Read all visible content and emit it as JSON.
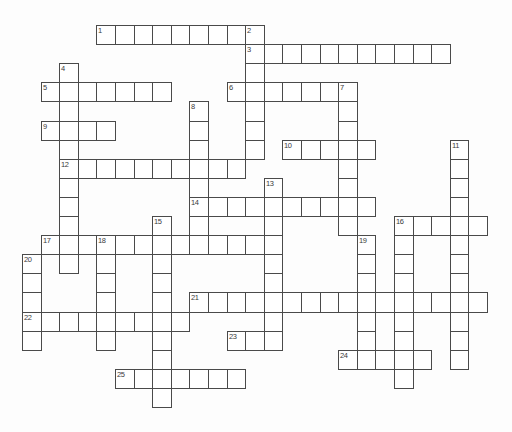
{
  "page": {
    "background_color": "#fdfdfd"
  },
  "grid": {
    "border_color": "#4a4a4a",
    "cell_fill_color": "#ffffff",
    "number_color": "#3a3a3a"
  },
  "puzzle": {
    "type": "crossword",
    "clue_numbers": [
      "1",
      "2",
      "3",
      "4",
      "5",
      "6",
      "7",
      "8",
      "9",
      "10",
      "11",
      "12",
      "13",
      "14",
      "15",
      "16",
      "17",
      "18",
      "19",
      "20",
      "21",
      "22",
      "23",
      "24",
      "25"
    ],
    "words": [
      {
        "num": "1",
        "dir": "across",
        "col": 4,
        "row": 0,
        "len": 9
      },
      {
        "num": "2",
        "dir": "down",
        "col": 12,
        "row": 0,
        "len": 7
      },
      {
        "num": "3",
        "dir": "across",
        "col": 12,
        "row": 1,
        "len": 11
      },
      {
        "num": "4",
        "dir": "down",
        "col": 2,
        "row": 2,
        "len": 11
      },
      {
        "num": "5",
        "dir": "across",
        "col": 1,
        "row": 3,
        "len": 7
      },
      {
        "num": "6",
        "dir": "across",
        "col": 11,
        "row": 3,
        "len": 7
      },
      {
        "num": "7",
        "dir": "down",
        "col": 17,
        "row": 3,
        "len": 8
      },
      {
        "num": "8",
        "dir": "down",
        "col": 9,
        "row": 4,
        "len": 8
      },
      {
        "num": "9",
        "dir": "across",
        "col": 1,
        "row": 5,
        "len": 4
      },
      {
        "num": "10",
        "dir": "across",
        "col": 14,
        "row": 6,
        "len": 5
      },
      {
        "num": "11",
        "dir": "down",
        "col": 23,
        "row": 6,
        "len": 12
      },
      {
        "num": "12",
        "dir": "across",
        "col": 2,
        "row": 7,
        "len": 10
      },
      {
        "num": "13",
        "dir": "down",
        "col": 13,
        "row": 8,
        "len": 9
      },
      {
        "num": "14",
        "dir": "across",
        "col": 9,
        "row": 9,
        "len": 10
      },
      {
        "num": "15",
        "dir": "down",
        "col": 7,
        "row": 10,
        "len": 10
      },
      {
        "num": "16",
        "dir": "across",
        "col": 20,
        "row": 10,
        "len": 5
      },
      {
        "num": "16",
        "dir": "down",
        "col": 20,
        "row": 10,
        "len": 9
      },
      {
        "num": "17",
        "dir": "across",
        "col": 1,
        "row": 11,
        "len": 12
      },
      {
        "num": "18",
        "dir": "down",
        "col": 4,
        "row": 11,
        "len": 6
      },
      {
        "num": "19",
        "dir": "down",
        "col": 18,
        "row": 11,
        "len": 7
      },
      {
        "num": "20",
        "dir": "down",
        "col": 0,
        "row": 12,
        "len": 5
      },
      {
        "num": "21",
        "dir": "across",
        "col": 9,
        "row": 14,
        "len": 16
      },
      {
        "num": "22",
        "dir": "across",
        "col": 0,
        "row": 15,
        "len": 9
      },
      {
        "num": "23",
        "dir": "across",
        "col": 11,
        "row": 16,
        "len": 3
      },
      {
        "num": "24",
        "dir": "across",
        "col": 17,
        "row": 17,
        "len": 5
      },
      {
        "num": "25",
        "dir": "across",
        "col": 5,
        "row": 18,
        "len": 7
      }
    ]
  }
}
